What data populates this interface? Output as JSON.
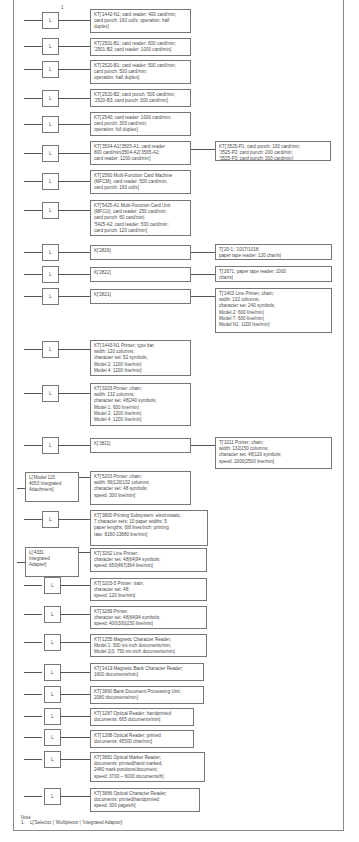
{
  "diagram": {
    "footnote_marker": "1",
    "rows": [
      {
        "left": "L",
        "kt": "KT['1442-N1; card reader: 400 card/min;\n    card punch: 160 col/s; operation: half\n    duplex]"
      },
      {
        "left": "L",
        "kt": "KT['2501-B1; card reader: 600 card/min;\n    '2501-B2; card reader: 1000 card/min]"
      },
      {
        "left": "L",
        "kt": "KT['2520-B1; card reader: 500 card/min;\n    card punch: 500 card/min;\n    operation: half duplex]"
      },
      {
        "left": "L",
        "kt": "KT['2520-B2; card punch: 500 card/min;\n    '2520-B3; card punch: 300 card/min]"
      },
      {
        "left": "L",
        "kt": "KT['2540; card reader: 1000 card/min;\n    card punch: 300 card/min;\n    operation: full duplex]"
      },
      {
        "left": "L",
        "kt": "KT['3504-A1|'3505-A1; card reader:\n    800 card/min|3504-A2|'3505-A2;\n    card reader: 1200 card/min]",
        "right": "KT['3525-P1; card punch: 100 card/min;\n    '3525-P2; card punch: 200 card/min;\n    '3525-P3; card punch: 300 card/min]"
      },
      {
        "left": "L",
        "kt": "KT['2560 Multi-Function Card Machine\n    (MFCM); card reader: 500 card/min;\n    card punch: 160 col/s]"
      },
      {
        "left": "L",
        "kt": "KT['5425-A1 Multi-Function Card Unit\n    (MFCU); card reader: 250 card/min;\n    card punch: 60 card/min|\n    '5425-A2; card reader: 500 card/min;\n    card punch: 120 card/min]"
      },
      {
        "left": "L",
        "kt": "K['2826]",
        "right": "T['20-1; '1017/1018;\n    paper tape reader: 120 char/s]"
      },
      {
        "left": "L",
        "kt": "K['2822]",
        "right": "T['2671; paper tape reader: 1000\n    char/s]"
      },
      {
        "left": "L",
        "kt": "K['2821]",
        "right": "T['1403 Line Printer; chain;\n    width: 132 columns;\n    character set: 240 symbols;\n    Model 2: 600 line/min|\n    Model 7: 600 line/min|\n    Model N1: 1100 line/min]"
      },
      {
        "left": "L",
        "kt": "KT['1443-N1 Printer; type bar;\n    width: 120 columns;\n    character set: 52 symbols;\n    Model 2: 1200 line/min|\n    Model 4: 1200 line/min]"
      },
      {
        "left": "L",
        "kt": "KT['3203 Printer:  chain;\n  width:  132 columns;\n  character set:  48|240 symbols;\n  Model 1:  600 line/min|\n  Model 2:  1200 line/min|\n  Model 4:  1200 line/min]"
      },
      {
        "left": "L",
        "kt": "K['3811]",
        "right": "T['3211 Printer; chain;\n    width: 132|150 columns;\n    character set: 48|120 symbols;\n    speed: 2000|2500 line/min]"
      },
      {
        "left": "L['Model 115\n  4053 Integrated\n  Attachment]",
        "kt": "KT['5203 Printer; chain;\n    width: 96|120|132 columns;\n    character set: 48 symbols;\n    speed: 300 line/min]"
      },
      {
        "left": "L",
        "kt": "KT['3800 Printing Subsystem: electrostatic;\n    7 character sets; 10 paper widths; 5\n    paper lengths; 6|8 lines/inch; printing\n    rate: 8180-13880 line/min]"
      },
      {
        "left": "L['4331\n  Integrated\n  Adapter]",
        "kt": "KT['3262 Line Printer;\n    character set: 48|64|94 symbols;\n    speed: 650|467|364 line/min]"
      },
      {
        "left": "L",
        "kt": "KT['3203-5 Printer: train;\n    character set: 48;\n    speed: 120 line/min]"
      },
      {
        "left": "L",
        "kt": "KT['3289 Printer;\n    character set: 48|64|94 symbols;\n    speed: 400|300|230 line/min]"
      },
      {
        "left": "L",
        "kt": "KT['1255 Magnetic Character Reader;\n    Model 1: 500 six-inch documents/min;\n    Model 2|3: 750 six-inch documents/min]"
      },
      {
        "left": "L",
        "kt": "KT['1419 Magnetic Bank Character Reader;\n    1600 documents/min]"
      },
      {
        "left": "L",
        "kt": "KT['3890 Bank Document Processing Unit;\n    2080 documents/min]"
      },
      {
        "left": "L",
        "kt": "KT['1287 Optical Reader; handprinted\n    documents: 665 documents/min]"
      },
      {
        "left": "L",
        "kt": "KT['1288 Optical Reader; printed\n    documents: 45500 char/min]"
      },
      {
        "left": "L",
        "kt": "KT['3881 Optical Marker Reader;\n    documents: printed|hand marked;\n    2480 mark positions/document;\n    speed: 3700 ~ 6000 documents/h]"
      },
      {
        "left": "L",
        "kt": "KT['3886 Optical Character Reader;\n    documents: printed|handprinted;\n    speed: 300 pages/h]"
      }
    ],
    "note": {
      "title": "Note",
      "items": [
        "1.    L['Selector | 'Multiplexor | 'Integrated Adaptor]"
      ]
    }
  }
}
